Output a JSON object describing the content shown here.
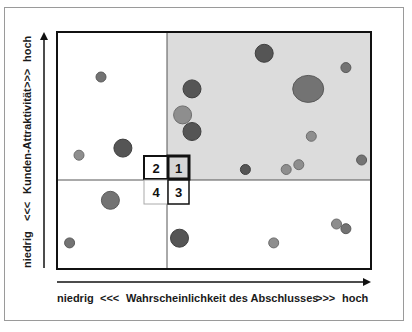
{
  "chart_data": {
    "type": "scatter",
    "subtype": "bubble-portfolio-matrix",
    "title": "",
    "xlabel": "niedrig   <<<   Wahrscheinlichkeit des Abschlusses   >>>   hoch",
    "ylabel": "niedrig   <<<   Kunden-Attraktivität   >>>   hoch",
    "x_axis": {
      "low_label": "niedrig",
      "arrows_low": "<<<",
      "title": "Wahrscheinlichkeit des Abschlusses",
      "arrows_high": ">>>",
      "high_label": "hoch"
    },
    "y_axis": {
      "low_label": "niedrig",
      "arrows_low": "<<<",
      "title": "Kunden-Attraktivität",
      "arrows_high": ">>>",
      "high_label": "hoch"
    },
    "xlim": [
      0,
      100
    ],
    "ylim": [
      0,
      100
    ],
    "grid": false,
    "legend": null,
    "quadrant_dividers": {
      "x": 35,
      "y": 38
    },
    "highlighted_quadrant": "1",
    "quadrants": [
      {
        "id": "1",
        "label": "1",
        "position": "top-right",
        "shaded": true
      },
      {
        "id": "2",
        "label": "2",
        "position": "top-left",
        "shaded": false
      },
      {
        "id": "3",
        "label": "3",
        "position": "bottom-right",
        "shaded": false
      },
      {
        "id": "4",
        "label": "4",
        "position": "bottom-left",
        "shaded": false
      }
    ],
    "points": [
      {
        "x": 14,
        "y": 81,
        "size": "small",
        "tone": "medium"
      },
      {
        "x": 21,
        "y": 51,
        "size": "medium",
        "tone": "dark"
      },
      {
        "x": 7,
        "y": 48,
        "size": "small",
        "tone": "light"
      },
      {
        "x": 17,
        "y": 29,
        "size": "medium",
        "tone": "medium"
      },
      {
        "x": 4,
        "y": 11,
        "size": "small",
        "tone": "medium"
      },
      {
        "x": 66,
        "y": 91,
        "size": "medium",
        "tone": "dark"
      },
      {
        "x": 43,
        "y": 76,
        "size": "medium",
        "tone": "dark"
      },
      {
        "x": 40,
        "y": 65,
        "size": "medium",
        "tone": "light"
      },
      {
        "x": 43,
        "y": 58,
        "size": "medium",
        "tone": "dark"
      },
      {
        "x": 80,
        "y": 76,
        "size": "large",
        "tone": "medium"
      },
      {
        "x": 92,
        "y": 85,
        "size": "small",
        "tone": "medium"
      },
      {
        "x": 81,
        "y": 56,
        "size": "small",
        "tone": "light"
      },
      {
        "x": 60,
        "y": 42,
        "size": "small",
        "tone": "dark"
      },
      {
        "x": 73,
        "y": 42,
        "size": "small",
        "tone": "light"
      },
      {
        "x": 77,
        "y": 44,
        "size": "small",
        "tone": "light"
      },
      {
        "x": 97,
        "y": 46,
        "size": "small",
        "tone": "medium"
      },
      {
        "x": 39,
        "y": 13,
        "size": "medium",
        "tone": "dark"
      },
      {
        "x": 69,
        "y": 11,
        "size": "small",
        "tone": "light"
      },
      {
        "x": 89,
        "y": 19,
        "size": "small",
        "tone": "light"
      },
      {
        "x": 92,
        "y": 17,
        "size": "small",
        "tone": "medium"
      }
    ]
  },
  "colors": {
    "shaded_quadrant": "#dcdcdc",
    "bubble_dark": "#555555",
    "bubble_medium": "#737373",
    "bubble_light": "#8e8e8e",
    "axis": "#111111",
    "frame": "#9a9a9a"
  },
  "labels": {
    "x_low": "niedrig",
    "x_arrows_low": "<<<",
    "x_title": "Wahrscheinlichkeit des Abschlusses",
    "x_arrows_high": ">>>",
    "x_high": "hoch",
    "y_low": "niedrig",
    "y_arrows_low": "<<<",
    "y_title": "Kunden-Attraktivität",
    "y_arrows_high": ">>>",
    "y_high": "hoch",
    "q1": "1",
    "q2": "2",
    "q3": "3",
    "q4": "4"
  }
}
